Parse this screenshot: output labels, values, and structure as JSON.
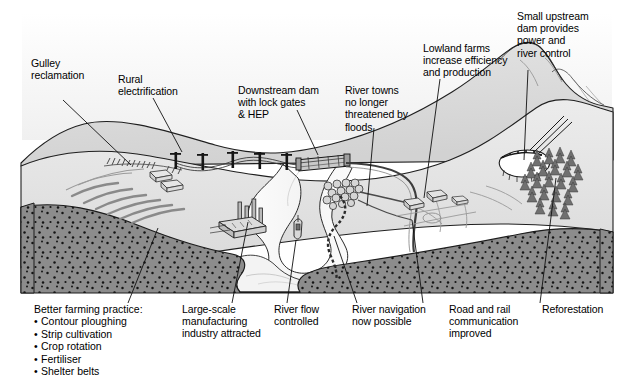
{
  "diagram": {
    "type": "annotated landscape block diagram",
    "colors": {
      "background": "#ffffff",
      "sky": "#f3f3f3",
      "upland_plateau": "#dcdcdc",
      "lowland_plain": "#e8e8e8",
      "valley_floor": "#f0f0f0",
      "river_water": "#fbfbfb",
      "rock_section": "#8c8c8c",
      "rock_stipple": "#111111",
      "outline": "#1a1a1a",
      "forest": "#6f6f6f",
      "reservoir": "#ffffff"
    }
  },
  "labels": {
    "gulley_reclamation": "Gulley\nreclamation",
    "rural_electrification": "Rural\nelectrification",
    "downstream_dam": "Downstream dam\nwith lock gates\n& HEP",
    "river_towns": "River towns\nno longer\nthreatened by\nfloods",
    "lowland_farms": "Lowland farms\nincrease efficiency\nand production",
    "small_upstream_dam": "Small upstream\ndam provides\npower and\nriver control",
    "large_scale_manufacturing": "Large-scale\nmanufacturing\nindustry attracted",
    "river_flow_controlled": "River flow\ncontrolled",
    "river_navigation": "River navigation\nnow possible",
    "road_and_rail": "Road and rail\ncommunication\nimproved",
    "reforestation": "Reforestation"
  },
  "farming_practice": {
    "heading": "Better farming practice:",
    "items": [
      "Contour ploughing",
      "Strip cultivation",
      "Crop rotation",
      "Fertiliser",
      "Shelter belts"
    ]
  },
  "features": {
    "pylons": 5,
    "farm_buildings_upland": 2,
    "factory_chimneys": 4,
    "town_cluster": "river town",
    "boat": "river barge",
    "forest_trees": 22,
    "upstream_dam": "arch dam with reservoir",
    "downstream_dam": "barrage with lock gates and HEP station"
  }
}
